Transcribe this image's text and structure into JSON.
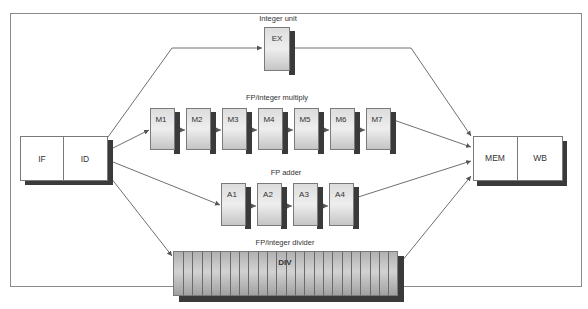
{
  "diagram": {
    "colors": {
      "frame": "#8a8a8a",
      "line": "#6e6e6e",
      "box_fill": "#ffffff",
      "box_stroke": "#7a7a7a",
      "shadow": "#3a3a3a",
      "unit_fill": "#c8c8c8",
      "unit_fill_light": "#e6e6e6",
      "div_fill": "#a8a8a8"
    },
    "front_stages": [
      {
        "label": "IF"
      },
      {
        "label": "ID"
      }
    ],
    "back_stages": [
      {
        "label": "MEM"
      },
      {
        "label": "WB"
      }
    ],
    "units": {
      "integer": {
        "title": "Integer unit",
        "stages": [
          {
            "label": "EX"
          }
        ]
      },
      "multiply": {
        "title": "FP/integer multiply",
        "stages": [
          {
            "label": "M1"
          },
          {
            "label": "M2"
          },
          {
            "label": "M3"
          },
          {
            "label": "M4"
          },
          {
            "label": "M5"
          },
          {
            "label": "M6"
          },
          {
            "label": "M7"
          }
        ]
      },
      "adder": {
        "title": "FP adder",
        "stages": [
          {
            "label": "A1"
          },
          {
            "label": "A2"
          },
          {
            "label": "A3"
          },
          {
            "label": "A4"
          }
        ]
      },
      "divider": {
        "title": "FP/integer divider",
        "stages": [
          {
            "label": "DIV"
          }
        ],
        "segments": 24
      }
    }
  }
}
